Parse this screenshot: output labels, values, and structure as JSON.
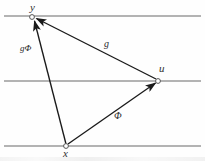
{
  "figure": {
    "type": "vector-triangle-diagram",
    "background_color": "#fefefe",
    "width": 205,
    "height": 161,
    "guide_line_color": "#9a9a9a",
    "edge_color": "#1a1a1a",
    "label_color": "#2a2a2a",
    "node_fill": "#ffffff"
  },
  "guide_lines": [
    {
      "name": "top-guide-line",
      "y": 16,
      "x1": 4,
      "x2": 201
    },
    {
      "name": "middle-guide-line",
      "y": 81,
      "x1": 4,
      "x2": 201
    },
    {
      "name": "bottom-guide-line",
      "y": 146,
      "x1": 4,
      "x2": 201
    }
  ],
  "nodes": [
    {
      "id": "y",
      "label": "y",
      "x": 32,
      "y": 17,
      "label_x": 30,
      "label_y": 2
    },
    {
      "id": "u",
      "label": "u",
      "x": 158,
      "y": 81,
      "label_x": 159,
      "label_y": 63
    },
    {
      "id": "x",
      "label": "x",
      "x": 66,
      "y": 146,
      "label_x": 63,
      "label_y": 148
    }
  ],
  "edges": [
    {
      "id": "x-to-y",
      "from": "x",
      "to": "y",
      "label": "gΦ",
      "label_x": 20,
      "label_y": 44,
      "arrowhead_at": "y"
    },
    {
      "id": "u-to-y",
      "from": "u",
      "to": "y",
      "label": "g",
      "label_x": 104,
      "label_y": 39,
      "arrowhead_at": "y"
    },
    {
      "id": "x-to-u",
      "from": "x",
      "to": "u",
      "label": "Φ",
      "label_x": 114,
      "label_y": 111,
      "arrowhead_at": "u"
    }
  ]
}
